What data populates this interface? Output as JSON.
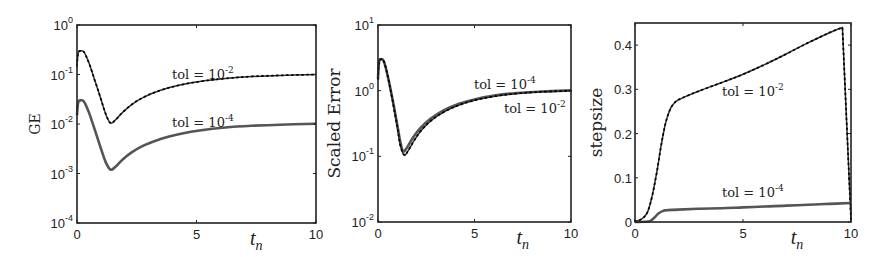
{
  "colors": {
    "axis": "#222222",
    "tol1e2": "#333333",
    "tol1e4": "#555555",
    "background": "#ffffff"
  },
  "chart_data": [
    {
      "id": "ge",
      "type": "line",
      "title": "",
      "xlabel": "t_n",
      "ylabel": "GE",
      "yscale": "log",
      "xlim": [
        0,
        10
      ],
      "ylim": [
        0.0001,
        1
      ],
      "xticks": [
        0,
        5,
        10
      ],
      "xtick_labels": [
        "0",
        "5",
        "10"
      ],
      "yticks": [
        1,
        0.1,
        0.01,
        0.001,
        0.0001
      ],
      "ytick_labels": [
        {
          "base": "10",
          "exp": "0"
        },
        {
          "base": "10",
          "exp": "-1"
        },
        {
          "base": "10",
          "exp": "-2"
        },
        {
          "base": "10",
          "exp": "-3"
        },
        {
          "base": "10",
          "exp": "-4"
        }
      ],
      "grid": false,
      "box": {
        "x0": 77,
        "y0": 25,
        "x1": 316,
        "y1": 223
      },
      "series": [
        {
          "name": "tol = 10^-2",
          "label_text": "tol = 10",
          "label_exp": "-2",
          "label_pos": {
            "x": 172,
            "y": 79
          },
          "style": "dotted-marker",
          "x": [
            0,
            0.05,
            0.15,
            0.3,
            0.5,
            0.75,
            1.0,
            1.2,
            1.4,
            1.6,
            1.9,
            2.3,
            2.8,
            3.5,
            4.3,
            5.2,
            6.2,
            7.3,
            8.5,
            10
          ],
          "y": [
            0.15,
            0.27,
            0.3,
            0.28,
            0.17,
            0.075,
            0.032,
            0.016,
            0.0105,
            0.012,
            0.017,
            0.025,
            0.035,
            0.048,
            0.061,
            0.073,
            0.083,
            0.091,
            0.096,
            0.1
          ]
        },
        {
          "name": "tol = 10^-4",
          "label_text": "tol = 10",
          "label_exp": "-4",
          "label_pos": {
            "x": 172,
            "y": 127
          },
          "style": "thick",
          "x": [
            0,
            0.05,
            0.15,
            0.3,
            0.5,
            0.75,
            1.0,
            1.2,
            1.4,
            1.6,
            1.9,
            2.3,
            2.8,
            3.5,
            4.3,
            5.2,
            6.2,
            7.3,
            8.5,
            10
          ],
          "y": [
            0.015,
            0.027,
            0.03,
            0.028,
            0.017,
            0.0075,
            0.0032,
            0.0017,
            0.0012,
            0.00135,
            0.0019,
            0.0027,
            0.0037,
            0.005,
            0.0063,
            0.0075,
            0.0085,
            0.0092,
            0.0097,
            0.0101
          ]
        }
      ]
    },
    {
      "id": "scaled-error",
      "type": "line",
      "title": "",
      "xlabel": "t_n",
      "ylabel": "Scaled Error",
      "yscale": "log",
      "xlim": [
        0,
        10
      ],
      "ylim": [
        0.01,
        10
      ],
      "xticks": [
        0,
        5,
        10
      ],
      "xtick_labels": [
        "0",
        "5",
        "10"
      ],
      "yticks": [
        10,
        1,
        0.1,
        0.01
      ],
      "ytick_labels": [
        {
          "base": "10",
          "exp": "1"
        },
        {
          "base": "10",
          "exp": "0"
        },
        {
          "base": "10",
          "exp": "-1"
        },
        {
          "base": "10",
          "exp": "-2"
        }
      ],
      "grid": false,
      "box": {
        "x0": 378,
        "y0": 25,
        "x1": 571,
        "y1": 222
      },
      "series": [
        {
          "name": "tol = 10^-4",
          "label_text": "tol = 10",
          "label_exp": "-4",
          "label_pos": {
            "x": 474,
            "y": 89
          },
          "style": "thick",
          "x": [
            0,
            0.05,
            0.15,
            0.3,
            0.5,
            0.75,
            1.0,
            1.15,
            1.3,
            1.5,
            1.8,
            2.2,
            2.7,
            3.4,
            4.2,
            5.1,
            6.1,
            7.2,
            8.5,
            10
          ],
          "y": [
            1.5,
            2.7,
            3.0,
            2.8,
            1.7,
            0.75,
            0.3,
            0.17,
            0.12,
            0.135,
            0.19,
            0.27,
            0.37,
            0.5,
            0.63,
            0.75,
            0.85,
            0.92,
            0.97,
            1.01
          ]
        },
        {
          "name": "tol = 10^-2",
          "label_text": "tol = 10",
          "label_exp": "-2",
          "label_pos": {
            "x": 504,
            "y": 113
          },
          "style": "dotted-marker",
          "x": [
            0,
            0.05,
            0.15,
            0.3,
            0.5,
            0.75,
            1.0,
            1.15,
            1.35,
            1.55,
            1.85,
            2.25,
            2.75,
            3.45,
            4.25,
            5.15,
            6.15,
            7.25,
            8.5,
            10
          ],
          "y": [
            1.5,
            2.7,
            3.0,
            2.8,
            1.7,
            0.72,
            0.28,
            0.15,
            0.105,
            0.12,
            0.17,
            0.25,
            0.35,
            0.48,
            0.61,
            0.73,
            0.83,
            0.91,
            0.96,
            1.0
          ]
        }
      ]
    },
    {
      "id": "stepsize",
      "type": "line",
      "title": "",
      "xlabel": "t_n",
      "ylabel": "stepsize",
      "yscale": "linear",
      "xlim": [
        0,
        10
      ],
      "ylim": [
        0,
        0.45
      ],
      "xticks": [
        0,
        5,
        10
      ],
      "xtick_labels": [
        "0",
        "5",
        "10"
      ],
      "yticks": [
        0,
        0.1,
        0.2,
        0.3,
        0.4
      ],
      "ytick_labels": [
        "0",
        "0.1",
        "0.2",
        "0.3",
        "0.4"
      ],
      "grid": false,
      "box": {
        "x0": 635,
        "y0": 23,
        "x1": 851,
        "y1": 222
      },
      "series": [
        {
          "name": "tol = 10^-2",
          "label_text": "tol = 10",
          "label_exp": "-2",
          "label_pos": {
            "x": 722,
            "y": 96
          },
          "style": "dotted-marker",
          "x": [
            0,
            0.2,
            0.4,
            0.6,
            0.8,
            1.0,
            1.2,
            1.4,
            1.6,
            1.8,
            2.0,
            2.4,
            3.0,
            4.0,
            5.0,
            6.0,
            7.0,
            8.0,
            9.0,
            9.6,
            10.0
          ],
          "y": [
            0.002,
            0.004,
            0.01,
            0.025,
            0.06,
            0.11,
            0.17,
            0.22,
            0.252,
            0.268,
            0.276,
            0.285,
            0.297,
            0.315,
            0.334,
            0.356,
            0.38,
            0.405,
            0.428,
            0.44,
            0.005
          ]
        },
        {
          "name": "tol = 10^-4",
          "label_text": "tol = 10",
          "label_exp": "-4",
          "label_pos": {
            "x": 722,
            "y": 197
          },
          "style": "thick",
          "x": [
            0,
            0.4,
            0.7,
            0.9,
            1.1,
            1.3,
            1.5,
            2.0,
            3.0,
            4.0,
            5.0,
            6.0,
            7.0,
            8.0,
            9.0,
            10.0
          ],
          "y": [
            0,
            0.0005,
            0.002,
            0.01,
            0.02,
            0.025,
            0.027,
            0.028,
            0.03,
            0.031,
            0.033,
            0.035,
            0.037,
            0.039,
            0.041,
            0.043
          ]
        }
      ]
    }
  ]
}
